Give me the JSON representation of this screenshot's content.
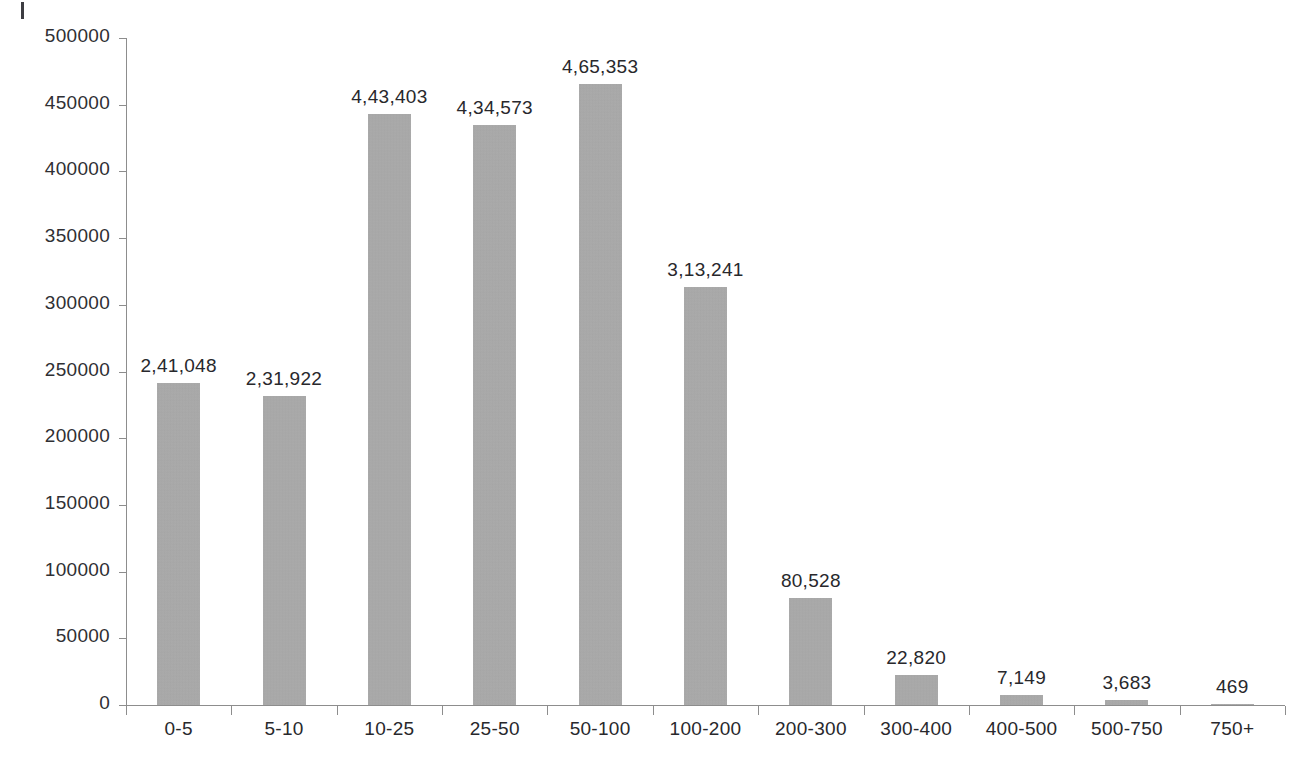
{
  "chart_data": {
    "type": "bar",
    "title": "",
    "subtitle": "",
    "xlabel": "",
    "ylabel": "",
    "ylim": [
      0,
      500000
    ],
    "ytick_step": 50000,
    "grid": false,
    "legend": null,
    "bar_color": "#a9a9a9",
    "axis_color": "#8d8d8d",
    "text_color": "#28282c",
    "number_format": "indian-lakh-grouping",
    "categories": [
      "0-5",
      "5-10",
      "10-25",
      "25-50",
      "50-100",
      "100-200",
      "200-300",
      "300-400",
      "400-500",
      "500-750",
      "750+"
    ],
    "values": [
      241048,
      231922,
      443403,
      434573,
      465353,
      313241,
      80528,
      22820,
      7149,
      3683,
      469
    ],
    "value_labels": [
      "2,41,048",
      "2,31,922",
      "4,43,403",
      "4,34,573",
      "4,65,353",
      "3,13,241",
      "80,528",
      "22,820",
      "7,149",
      "3,683",
      "469"
    ],
    "ytick_labels": [
      "0",
      "50000",
      "100000",
      "150000",
      "200000",
      "250000",
      "300000",
      "350000",
      "400000",
      "450000",
      "500000"
    ],
    "ytick_values": [
      0,
      50000,
      100000,
      150000,
      200000,
      250000,
      300000,
      350000,
      400000,
      450000,
      500000
    ]
  },
  "page": {
    "bottom_caption": ""
  }
}
